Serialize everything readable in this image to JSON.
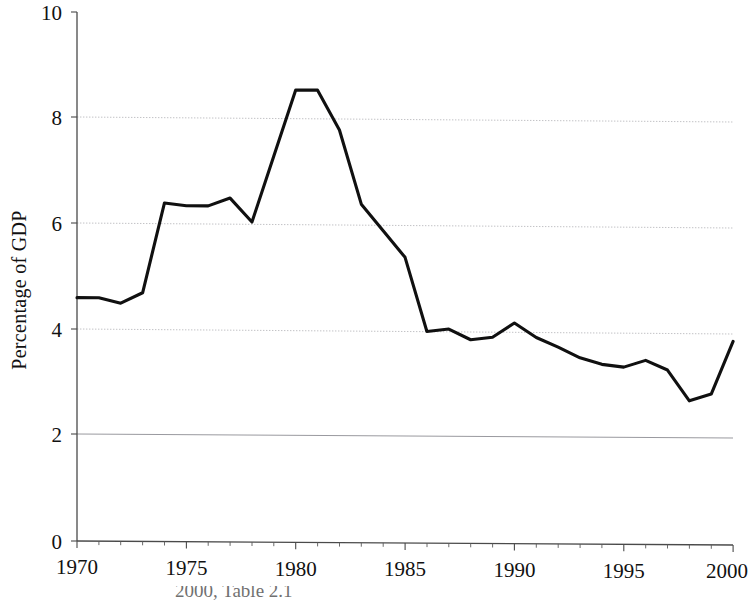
{
  "chart_data": {
    "type": "line",
    "title": "",
    "subtitle": "",
    "xlabel": "",
    "ylabel": "Percentage of GDP",
    "xlim": [
      1970,
      2000
    ],
    "ylim": [
      0,
      10
    ],
    "ytick_values": [
      0,
      2,
      4,
      6,
      8,
      10
    ],
    "ytick_labels": [
      "0",
      "2",
      "4",
      "6",
      "8",
      "10"
    ],
    "xtick_values": [
      1970,
      1975,
      1980,
      1985,
      1990,
      1995,
      2000
    ],
    "xtick_labels": [
      "1970",
      "1975",
      "1980",
      "1985",
      "1990",
      "1995",
      "2000"
    ],
    "x_minor_tick_step": 1,
    "grid": "horizontal-only",
    "gridline_values": [
      2,
      4,
      6,
      8
    ],
    "legend": null,
    "legend_position": "none",
    "annotations": [],
    "series": [
      {
        "name": "Percentage of GDP",
        "color": "#101010",
        "x": [
          1970,
          1971,
          1972,
          1973,
          1974,
          1975,
          1976,
          1977,
          1978,
          1979,
          1980,
          1981,
          1982,
          1983,
          1984,
          1985,
          1986,
          1987,
          1988,
          1989,
          1990,
          1991,
          1992,
          1993,
          1994,
          1995,
          1996,
          1997,
          1998,
          1999,
          2000
        ],
        "values": [
          4.6,
          4.6,
          4.5,
          4.7,
          6.4,
          6.35,
          6.35,
          6.5,
          6.05,
          7.3,
          8.55,
          8.55,
          7.8,
          6.4,
          5.9,
          5.4,
          4.0,
          4.05,
          3.85,
          3.9,
          4.17,
          3.9,
          3.72,
          3.52,
          3.4,
          3.35,
          3.48,
          3.3,
          2.72,
          2.85,
          3.85
        ]
      }
    ]
  },
  "axes": {
    "ylabel": "Percentage of GDP",
    "ytick_labels": [
      "10",
      "8",
      "6",
      "4",
      "2",
      "0"
    ],
    "xtick_labels": [
      "1970",
      "1975",
      "1980",
      "1985",
      "1990",
      "1995",
      "2000"
    ]
  },
  "caption": {
    "text": "2000, Table 2.1",
    "visible": "partially-cut-off"
  },
  "colors": {
    "line": "#101010",
    "gridline": "#b9b9bd",
    "axis": "#4a4a4a",
    "text": "#111111",
    "background": "#ffffff"
  }
}
